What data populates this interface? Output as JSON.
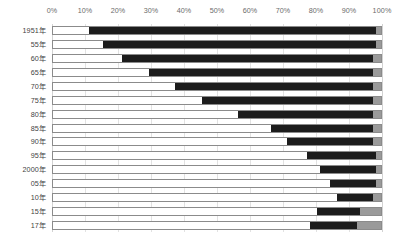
{
  "chart_data": {
    "type": "bar",
    "orientation": "horizontal",
    "stacked": true,
    "stack_mode": "percent",
    "title": "",
    "subtitle": "",
    "xlabel": "",
    "ylabel": "",
    "xlim": [
      0,
      100
    ],
    "grid": true,
    "grid_axis": "x",
    "legend": "none",
    "x_tick_labels": [
      "0%",
      "10%",
      "20%",
      "30%",
      "40%",
      "50%",
      "60%",
      "70%",
      "80%",
      "90%",
      "100%"
    ],
    "x_tick_values": [
      0,
      10,
      20,
      30,
      40,
      50,
      60,
      70,
      80,
      90,
      100
    ],
    "categories": [
      "1951年",
      "55年",
      "60年",
      "65年",
      "70年",
      "75年",
      "80年",
      "85年",
      "90年",
      "95年",
      "2000年",
      "05年",
      "10年",
      "15年",
      "17年"
    ],
    "series": [
      {
        "name": "segment-1",
        "color": "#ffffff",
        "values": [
          11,
          15,
          21,
          29,
          37,
          45,
          56,
          66,
          71,
          77,
          81,
          84,
          86,
          80,
          78
        ]
      },
      {
        "name": "segment-2",
        "color": "#1c1c1c",
        "values": [
          87,
          83,
          76,
          68,
          60,
          52,
          41,
          31,
          26,
          21,
          17,
          14,
          11,
          13,
          14
        ]
      },
      {
        "name": "segment-3",
        "color": "#9a9a9a",
        "values": [
          2,
          2,
          3,
          3,
          3,
          3,
          3,
          3,
          3,
          2,
          2,
          2,
          3,
          7,
          8
        ]
      }
    ]
  },
  "axis": {
    "tick_0": "0%",
    "tick_1": "10%",
    "tick_2": "20%",
    "tick_3": "30%",
    "tick_4": "40%",
    "tick_5": "50%",
    "tick_6": "60%",
    "tick_7": "70%",
    "tick_8": "80%",
    "tick_9": "90%",
    "tick_10": "100%"
  },
  "colors": {
    "segment_1": "#ffffff",
    "segment_2": "#1c1c1c",
    "segment_3": "#9a9a9a",
    "gridline": "#e2e2e2",
    "bar_border": "#8b8b8b",
    "tick_text": "#6b6b6b",
    "category_text": "#3f3f3f",
    "background": "#ffffff"
  }
}
